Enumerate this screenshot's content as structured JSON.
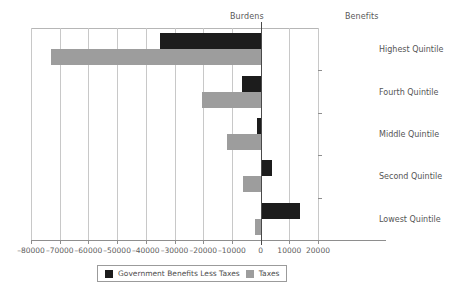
{
  "chart_data": {
    "type": "bar",
    "orientation": "horizontal",
    "title": "",
    "xlabel": "",
    "ylabel": "",
    "categories": [
      "Highest Quintile",
      "Fourth Quintile",
      "Middle Quintile",
      "Second Quintile",
      "Lowest Quintile"
    ],
    "series": [
      {
        "name": "Government Benefits Less Taxes",
        "color": "#1c1c1c",
        "values": [
          -35000,
          -6500,
          -1200,
          4100,
          13800
        ]
      },
      {
        "name": "Taxes",
        "color": "#9d9d9d",
        "values": [
          -73000,
          -20500,
          -11800,
          -6000,
          -2000
        ]
      }
    ],
    "xlim": [
      -80000,
      20000
    ],
    "xticks": [
      -80000,
      -70000,
      -60000,
      -50000,
      -40000,
      -30000,
      -20000,
      -10000,
      0,
      10000,
      20000
    ],
    "xtick_labels": [
      "–80000",
      "–70000",
      "–60000",
      "–50000",
      "–40000",
      "–30000",
      "–20000",
      "–10000",
      "0",
      "10000",
      "20000"
    ],
    "grid": true,
    "grid_axis": "x",
    "legend_position": "bottom",
    "annotations": [
      {
        "text": "Burdens",
        "position": "top-left-of-zero"
      },
      {
        "text": "Benefits",
        "position": "top-right-of-zero"
      }
    ]
  },
  "regions": {
    "burdens": "Burdens",
    "benefits": "Benefits"
  },
  "legend": {
    "items": [
      {
        "label": "Government Benefits Less Taxes",
        "swatch": "dark"
      },
      {
        "label": "Taxes",
        "swatch": "light"
      }
    ]
  }
}
